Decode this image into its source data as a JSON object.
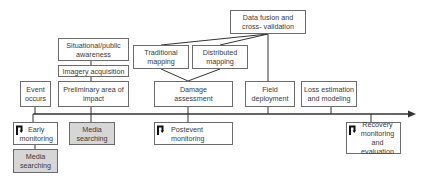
{
  "diagram": {
    "type": "timeline-flow",
    "timeline": {
      "direction": "left-to-right",
      "color": "#333333"
    },
    "above_timeline": {
      "event_occurs": "Event\noccurs",
      "preliminary_area": "Preliminary area of\nimpact",
      "situational_awareness": "Situational/public\nawareness",
      "imagery_acquisition": "Imagery acquisition",
      "traditional_mapping": "Traditional\nmapping",
      "distributed_mapping": "Distributed\nmapping",
      "damage_assessment": "Damage\nassessment",
      "data_fusion": "Data fusion and\ncross- validation",
      "field_deployment": "Field\ndeployment",
      "loss_estimation": "Loss estimation\nand modeling"
    },
    "below_timeline": {
      "early_monitoring": "Early\nmonitoring",
      "media_searching_left": "Media\nsearching",
      "media_searching_mid": "Media\nsearching",
      "postevent_monitoring": "Postevent\nmonitoring",
      "recovery_monitoring": "Recovery\nmonitoring and\nevaluation"
    },
    "colors": {
      "border": "#6b6b6b",
      "shaded_fill": "#d6d6d6",
      "text": "#3a3a3a",
      "line": "#333333"
    },
    "icons": {
      "monitoring_marker": "return-arrow-icon"
    }
  }
}
